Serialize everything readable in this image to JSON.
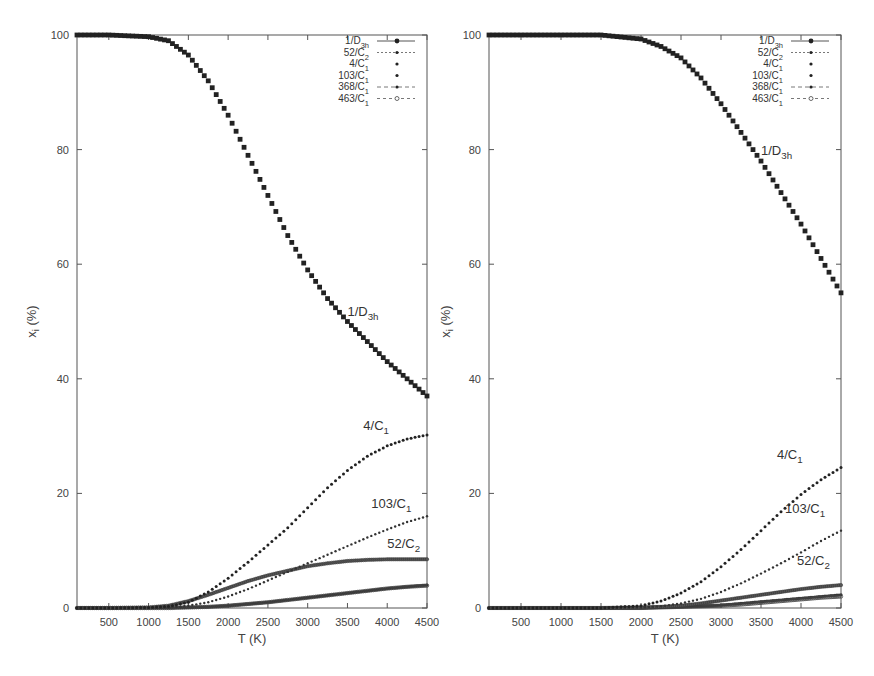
{
  "chart_data": [
    {
      "type": "scatter",
      "title": "",
      "xlabel": "T (K)",
      "ylabel": "x_i (%)",
      "xlim": [
        100,
        4500
      ],
      "ylim": [
        0,
        100
      ],
      "xticks": [
        500,
        1000,
        1500,
        2000,
        2500,
        3000,
        3500,
        4000,
        4500
      ],
      "yticks": [
        0,
        20,
        40,
        60,
        80,
        100
      ],
      "grid": false,
      "legend_position": "top-right",
      "legend": [
        "1/D3h",
        "52/C2",
        "4/C1",
        "103/C1",
        "368/C1",
        "463/C1"
      ],
      "x": [
        100,
        500,
        1000,
        1250,
        1500,
        1750,
        2000,
        2250,
        2500,
        2750,
        3000,
        3250,
        3500,
        3750,
        4000,
        4250,
        4500
      ],
      "series": [
        {
          "name": "1/D3h",
          "values": [
            100,
            100,
            99.7,
            99,
            96.5,
            92,
            86,
            79,
            72,
            65,
            59,
            54,
            50,
            46.5,
            43,
            40,
            37
          ]
        },
        {
          "name": "52/C2",
          "values": [
            0,
            0,
            0.1,
            0.4,
            1.2,
            2.3,
            3.5,
            4.7,
            5.7,
            6.5,
            7.3,
            7.8,
            8.2,
            8.4,
            8.5,
            8.5,
            8.5
          ]
        },
        {
          "name": "4/C1",
          "values": [
            0,
            0,
            0.1,
            0.3,
            1,
            2.8,
            5.2,
            8,
            11,
            14,
            17.5,
            21,
            24,
            26.5,
            28.3,
            29.5,
            30.2
          ]
        },
        {
          "name": "103/C1",
          "values": [
            0,
            0,
            0,
            0.1,
            0.4,
            1,
            2,
            3.3,
            4.8,
            6.3,
            7.8,
            9.3,
            10.8,
            12.3,
            13.7,
            15,
            16
          ]
        },
        {
          "name": "368/C1",
          "values": [
            0,
            0,
            0,
            0,
            0.1,
            0.2,
            0.4,
            0.7,
            1,
            1.4,
            1.8,
            2.2,
            2.6,
            3,
            3.4,
            3.7,
            4
          ]
        },
        {
          "name": "463/C1",
          "values": [
            0,
            0,
            0,
            0,
            0.1,
            0.2,
            0.4,
            0.7,
            1,
            1.4,
            1.8,
            2.2,
            2.6,
            3,
            3.4,
            3.7,
            3.9
          ]
        }
      ],
      "annotations": [
        {
          "text": "1/D3h",
          "x": 3500,
          "y": 51
        },
        {
          "text": "4/C1",
          "x": 3700,
          "y": 31
        },
        {
          "text": "103/C1",
          "x": 3800,
          "y": 17.5
        },
        {
          "text": "52/C2",
          "x": 4000,
          "y": 10.5
        }
      ]
    },
    {
      "type": "scatter",
      "title": "",
      "xlabel": "T (K)",
      "ylabel": "x_i (%)",
      "xlim": [
        100,
        4500
      ],
      "ylim": [
        0,
        100
      ],
      "xticks": [
        500,
        1000,
        1500,
        2000,
        2500,
        3000,
        3500,
        4000,
        4500
      ],
      "yticks": [
        0,
        20,
        40,
        60,
        80,
        100
      ],
      "grid": false,
      "legend_position": "top-right",
      "legend": [
        "1/D3h",
        "52/C2",
        "4/C1",
        "103/C1",
        "368/C1",
        "463/C1"
      ],
      "x": [
        100,
        500,
        1000,
        1500,
        2000,
        2250,
        2500,
        2750,
        3000,
        3250,
        3500,
        3750,
        4000,
        4250,
        4500
      ],
      "series": [
        {
          "name": "1/D3h",
          "values": [
            100,
            100,
            100,
            100,
            99.3,
            98,
            96,
            92.5,
            88,
            83,
            78,
            72.5,
            67,
            61,
            55
          ]
        },
        {
          "name": "52/C2",
          "values": [
            0,
            0,
            0,
            0,
            0.1,
            0.2,
            0.4,
            0.8,
            1.3,
            1.8,
            2.3,
            2.8,
            3.3,
            3.7,
            4
          ]
        },
        {
          "name": "4/C1",
          "values": [
            0,
            0,
            0,
            0,
            0.4,
            1.2,
            2.6,
            4.6,
            7.2,
            10.2,
            13.5,
            16.8,
            19.8,
            22.4,
            24.5
          ]
        },
        {
          "name": "103/C1",
          "values": [
            0,
            0,
            0,
            0,
            0.1,
            0.3,
            0.8,
            1.6,
            2.8,
            4.3,
            6,
            7.8,
            9.7,
            11.7,
            13.5
          ]
        },
        {
          "name": "368/C1",
          "values": [
            0,
            0,
            0,
            0,
            0,
            0.1,
            0.2,
            0.3,
            0.5,
            0.8,
            1.1,
            1.4,
            1.7,
            2,
            2.3
          ]
        },
        {
          "name": "463/C1",
          "values": [
            0,
            0,
            0,
            0,
            0,
            0.1,
            0.2,
            0.3,
            0.4,
            0.6,
            0.9,
            1.2,
            1.5,
            1.8,
            2
          ]
        }
      ],
      "annotations": [
        {
          "text": "1/D3h",
          "x": 3500,
          "y": 79
        },
        {
          "text": "4/C1",
          "x": 3700,
          "y": 26
        },
        {
          "text": "103/C1",
          "x": 3800,
          "y": 16.5
        },
        {
          "text": "52/C2",
          "x": 3950,
          "y": 7.5
        }
      ]
    }
  ],
  "panels": [
    {
      "xlabel": "T (K)",
      "ylabel_main": "x",
      "ylabel_sub": "i",
      "ylabel_rest": " (%)",
      "legend": [
        {
          "main": "1/D",
          "sub": "3h"
        },
        {
          "main": "52/C",
          "sub": "2"
        },
        {
          "main": "4/C",
          "sub": "1"
        },
        {
          "main": "103/C",
          "sub": "1"
        },
        {
          "main": "368/C",
          "sub": "1"
        },
        {
          "main": "463/C",
          "sub": "1"
        }
      ],
      "annotations": [
        {
          "main": "1/D",
          "sub": "3h"
        },
        {
          "main": "4/C",
          "sub": "1"
        },
        {
          "main": "103/C",
          "sub": "1"
        },
        {
          "main": "52/C",
          "sub": "2"
        }
      ]
    },
    {
      "xlabel": "T (K)",
      "ylabel_main": "x",
      "ylabel_sub": "i",
      "ylabel_rest": " (%)",
      "legend": [
        {
          "main": "1/D",
          "sub": "3h"
        },
        {
          "main": "52/C",
          "sub": "2"
        },
        {
          "main": "4/C",
          "sub": "1"
        },
        {
          "main": "103/C",
          "sub": "1"
        },
        {
          "main": "368/C",
          "sub": "1"
        },
        {
          "main": "463/C",
          "sub": "1"
        }
      ],
      "annotations": [
        {
          "main": "1/D",
          "sub": "3h"
        },
        {
          "main": "4/C",
          "sub": "1"
        },
        {
          "main": "103/C",
          "sub": "1"
        },
        {
          "main": "52/C",
          "sub": "2"
        }
      ]
    }
  ]
}
